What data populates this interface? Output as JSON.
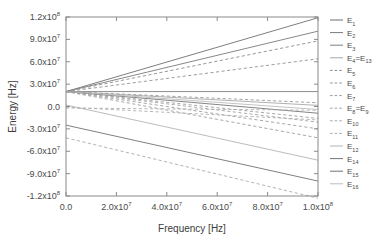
{
  "figure": {
    "title": "",
    "background": "#ffffff",
    "frame_color": "#8a8a8a"
  },
  "axes": {
    "xlabel": "Frequency [Hz]",
    "ylabel": "Energy [Hz]",
    "xlim": [
      0,
      100000000
    ],
    "ylim": [
      -120000000,
      120000000
    ],
    "grid": false,
    "xticks": [
      {
        "value": 0,
        "mantissa": "0.0",
        "exponent": ""
      },
      {
        "value": 20000000,
        "mantissa": "2.0x10",
        "exponent": "7"
      },
      {
        "value": 40000000,
        "mantissa": "4.0x10",
        "exponent": "7"
      },
      {
        "value": 60000000,
        "mantissa": "6.0x10",
        "exponent": "7"
      },
      {
        "value": 80000000,
        "mantissa": "8.0x10",
        "exponent": "7"
      },
      {
        "value": 100000000,
        "mantissa": "1.0x10",
        "exponent": "8"
      }
    ],
    "yticks": [
      {
        "value": 120000000,
        "mantissa": "1.2x10",
        "exponent": "8"
      },
      {
        "value": 90000000,
        "mantissa": "9.0x10",
        "exponent": "7"
      },
      {
        "value": 60000000,
        "mantissa": "6.0x10",
        "exponent": "7"
      },
      {
        "value": 30000000,
        "mantissa": "3.0x10",
        "exponent": "7"
      },
      {
        "value": 0,
        "mantissa": "0.0",
        "exponent": ""
      },
      {
        "value": -30000000,
        "mantissa": "-3.0x10",
        "exponent": "7"
      },
      {
        "value": -60000000,
        "mantissa": "-6.0x10",
        "exponent": "7"
      },
      {
        "value": -90000000,
        "mantissa": "-9.0x10",
        "exponent": "7"
      },
      {
        "value": -120000000,
        "mantissa": "-1.2x10",
        "exponent": "8"
      }
    ]
  },
  "chart_data": {
    "type": "line",
    "title": "",
    "xlabel": "Frequency [Hz]",
    "ylabel": "Energy [Hz]",
    "xlim": [
      0,
      100000000
    ],
    "ylim": [
      -120000000,
      120000000
    ],
    "grid": false,
    "legend_position": "right-outside",
    "x": [
      0,
      100000000
    ],
    "series": [
      {
        "name": "E1",
        "label_base": "E",
        "label_sub": "1",
        "style": "solid",
        "color": "#6f6f6f",
        "values": [
          20000000,
          119000000
        ]
      },
      {
        "name": "E2",
        "label_base": "E",
        "label_sub": "2",
        "style": "solid",
        "color": "#7a7a7a",
        "values": [
          20000000,
          101000000
        ]
      },
      {
        "name": "E3",
        "label_base": "E",
        "label_sub": "3",
        "style": "solid",
        "color": "#7f7f7f",
        "values": [
          20000000,
          20000000
        ]
      },
      {
        "name": "E4",
        "label_base": "E",
        "label_sub": "4",
        "label_extra": "=E",
        "label_extra_sub": "13",
        "style": "solid",
        "color": "#a8a8a8",
        "values": [
          20000000,
          1500000
        ]
      },
      {
        "name": "E5",
        "label_base": "E",
        "label_sub": "5",
        "style": "dashed",
        "color": "#8d8d8d",
        "values": [
          20000000,
          88000000
        ]
      },
      {
        "name": "E6",
        "label_base": "E",
        "label_sub": "6",
        "style": "dashed",
        "color": "#949494",
        "values": [
          20000000,
          64000000
        ]
      },
      {
        "name": "E7",
        "label_base": "E",
        "label_sub": "7",
        "style": "dashed",
        "color": "#9a9a9a",
        "values": [
          20000000,
          5000000
        ]
      },
      {
        "name": "E8",
        "label_base": "E",
        "label_sub": "8",
        "label_extra": "=E",
        "label_extra_sub": "9",
        "style": "dashed",
        "color": "#a0a0a0",
        "values": [
          20000000,
          -16000000
        ]
      },
      {
        "name": "E10",
        "label_base": "E",
        "label_sub": "10",
        "style": "dashed",
        "color": "#a5a5a5",
        "values": [
          20000000,
          -21000000
        ]
      },
      {
        "name": "E11",
        "label_base": "E",
        "label_sub": "11",
        "style": "dashed",
        "color": "#aaaaaa",
        "values": [
          -42000000,
          -123000000
        ]
      },
      {
        "name": "E12",
        "label_base": "E",
        "label_sub": "12",
        "style": "solid",
        "color": "#b4b4b4",
        "values": [
          2000000,
          -72000000
        ]
      },
      {
        "name": "E14",
        "label_base": "E",
        "label_sub": "14",
        "style": "solid",
        "color": "#767676",
        "values": [
          20000000,
          -9000000
        ]
      },
      {
        "name": "E15",
        "label_base": "E",
        "label_sub": "15",
        "style": "solid",
        "color": "#727272",
        "values": [
          -25000000,
          -100000000
        ]
      },
      {
        "name": "E16",
        "label_base": "E",
        "label_sub": "16",
        "style": "solid",
        "color": "#bcbcbc",
        "values": [
          20000000,
          -4000000
        ]
      }
    ],
    "extra_lines": [
      {
        "name": "E9-dashed",
        "style": "dashed",
        "color": "#9e9e9e",
        "values": [
          20000000,
          -30000000
        ]
      },
      {
        "name": "E13-dashed",
        "style": "dashed",
        "color": "#9e9e9e",
        "values": [
          20000000,
          -42000000
        ]
      },
      {
        "name": "E-mid-a",
        "style": "dashed",
        "color": "#b0b0b0",
        "values": [
          -1000000,
          -18000000
        ]
      },
      {
        "name": "E-mid-b",
        "style": "dashed",
        "color": "#b0b0b0",
        "values": [
          -2000000,
          -5000000
        ]
      }
    ]
  },
  "legend": {
    "entries": [
      {
        "base": "E",
        "sub": "1",
        "style": "solid",
        "color": "#6f6f6f"
      },
      {
        "base": "E",
        "sub": "2",
        "style": "solid",
        "color": "#7a7a7a"
      },
      {
        "base": "E",
        "sub": "3",
        "style": "solid",
        "color": "#7f7f7f"
      },
      {
        "base": "E",
        "sub": "4",
        "extra": "=E",
        "extra_sub": "13",
        "style": "solid",
        "color": "#a8a8a8"
      },
      {
        "base": "E",
        "sub": "5",
        "style": "dashed",
        "color": "#8d8d8d"
      },
      {
        "base": "E",
        "sub": "6",
        "style": "dashed",
        "color": "#949494"
      },
      {
        "base": "E",
        "sub": "7",
        "style": "dashed",
        "color": "#9a9a9a"
      },
      {
        "base": "E",
        "sub": "8",
        "extra": "=E",
        "extra_sub": "9",
        "style": "dashed",
        "color": "#a0a0a0"
      },
      {
        "base": "E",
        "sub": "10",
        "style": "dashed",
        "color": "#a5a5a5"
      },
      {
        "base": "E",
        "sub": "11",
        "style": "dashed",
        "color": "#aaaaaa"
      },
      {
        "base": "E",
        "sub": "12",
        "style": "solid",
        "color": "#b4b4b4"
      },
      {
        "base": "E",
        "sub": "14",
        "style": "solid",
        "color": "#767676"
      },
      {
        "base": "E",
        "sub": "15",
        "style": "solid",
        "color": "#727272"
      },
      {
        "base": "E",
        "sub": "16",
        "style": "solid",
        "color": "#bcbcbc"
      }
    ]
  }
}
